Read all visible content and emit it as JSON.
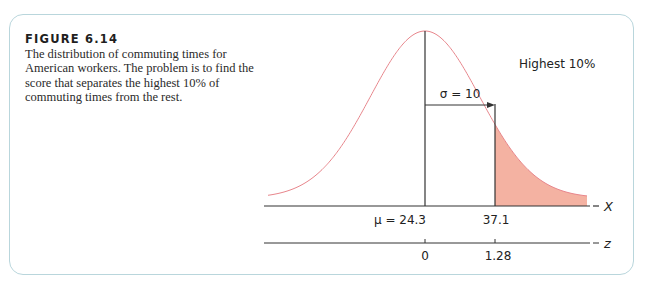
{
  "figure": {
    "label": "FIGURE 6.14",
    "caption": "The distribution of commuting times for American workers. The problem is to find the score that separates the highest 10% of commuting times from the rest."
  },
  "annotations": {
    "tail_label": "Highest 10%",
    "sigma_label": "σ = 10",
    "mu_label": "μ = 24.3",
    "cutoff_label": "37.1",
    "x_axis_label": "X",
    "z_axis_label": "z",
    "z_zero_label": "0",
    "z_cutoff_label": "1.28"
  },
  "colors": {
    "curve": "#e8868c",
    "shade": "#f4b2a2",
    "frame": "#b9d6dc",
    "axis": "#333333"
  },
  "chart_data": {
    "type": "area",
    "title": "FIGURE 6.14",
    "distribution": {
      "mean": 24.3,
      "sd": 10
    },
    "shaded_region": {
      "from_x": 37.1,
      "to": "+inf",
      "proportion": 0.1,
      "label": "Highest 10%"
    },
    "x_axis": {
      "label": "X",
      "ticks": [
        24.3,
        37.1
      ],
      "tick_labels": [
        "μ = 24.3",
        "37.1"
      ]
    },
    "z_axis": {
      "label": "z",
      "ticks": [
        0,
        1.28
      ],
      "tick_labels": [
        "0",
        "1.28"
      ]
    },
    "annotations": [
      "σ = 10",
      "Highest 10%"
    ],
    "grid": false,
    "legend": "none"
  }
}
